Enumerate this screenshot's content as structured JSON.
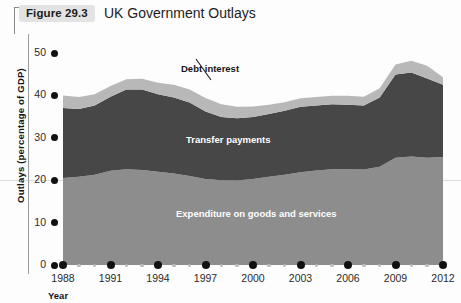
{
  "figure": {
    "number_label": "Figure 29.3",
    "title": "UK Government Outlays"
  },
  "axes": {
    "y_axis_title": "Outlays (percentage of GDP)",
    "x_axis_title": "Year",
    "y_ticks": [
      "0",
      "10",
      "20",
      "30",
      "40",
      "50"
    ],
    "x_ticks": [
      "1988",
      "1991",
      "1994",
      "1997",
      "2000",
      "2003",
      "2006",
      "2009",
      "2012"
    ]
  },
  "annotations": {
    "debt_interest": "Debt interest",
    "transfer_payments": "Transfer payments",
    "expenditure": "Expenditure on goods and services"
  },
  "colors": {
    "debt_interest": "#b8b8b8",
    "transfer_payments": "#474747",
    "expenditure": "#8d8d8d",
    "badge_background": "#e3e3e3",
    "gridline": "#dcdcdc",
    "axis": "#9a9a9a"
  },
  "chart_data": {
    "type": "area",
    "title": "UK Government Outlays",
    "xlabel": "Year",
    "ylabel": "Outlays (percentage of GDP)",
    "xlim": [
      1988,
      2012
    ],
    "ylim": [
      0,
      50
    ],
    "grid": true,
    "legend": "inline-annotations",
    "stacked": true,
    "x": [
      1988,
      1989,
      1990,
      1991,
      1992,
      1993,
      1994,
      1995,
      1996,
      1997,
      1998,
      1999,
      2000,
      2001,
      2002,
      2003,
      2004,
      2005,
      2006,
      2007,
      2008,
      2009,
      2010,
      2011,
      2012
    ],
    "series": [
      {
        "name": "Expenditure on goods and services",
        "values": [
          20.5,
          20.8,
          21.3,
          22.2,
          22.6,
          22.4,
          22.0,
          21.6,
          21.0,
          20.3,
          20.0,
          19.9,
          20.3,
          20.8,
          21.3,
          21.9,
          22.3,
          22.6,
          22.6,
          22.5,
          23.2,
          25.3,
          25.6,
          25.3,
          25.5
        ]
      },
      {
        "name": "Transfer payments",
        "values": [
          16.5,
          16.0,
          16.3,
          17.5,
          18.8,
          19.0,
          18.3,
          17.9,
          17.3,
          15.9,
          14.9,
          14.7,
          14.6,
          14.8,
          15.1,
          15.4,
          15.3,
          15.3,
          15.2,
          15.1,
          16.3,
          19.6,
          19.8,
          18.7,
          17.0
        ]
      },
      {
        "name": "Debt interest",
        "values": [
          3.0,
          2.8,
          2.7,
          2.5,
          2.4,
          2.5,
          2.7,
          3.0,
          3.1,
          3.2,
          3.0,
          2.7,
          2.5,
          2.2,
          2.0,
          2.0,
          2.0,
          2.0,
          2.1,
          2.1,
          2.2,
          2.4,
          2.8,
          3.0,
          1.8
        ]
      }
    ],
    "totals": [
      40.0,
      39.6,
      40.3,
      42.2,
      43.8,
      43.9,
      43.0,
      42.5,
      41.4,
      39.4,
      37.9,
      37.3,
      37.4,
      37.8,
      38.4,
      39.3,
      39.6,
      39.9,
      39.9,
      39.7,
      41.7,
      47.3,
      48.2,
      47.0,
      44.3
    ]
  }
}
